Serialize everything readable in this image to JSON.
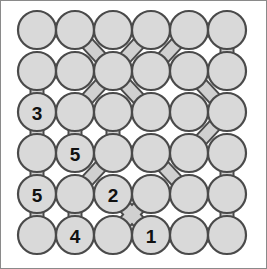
{
  "puzzle": {
    "title": "Circle Link Puzzle",
    "type": "circle-link-grid",
    "rows": 6,
    "cols": 6,
    "background_color": "#ffffff",
    "circle_fill": "#d9d9d9",
    "circle_stroke": "#4a4a4a",
    "link_fill": "#d0d0d0",
    "link_stroke": "#4a4a4a",
    "frame_stroke": "#8a8a8a",
    "geometry": {
      "origin_x": 36,
      "origin_y": 29,
      "step_x": 38,
      "step_y": 41,
      "radius": 19
    },
    "nodes": [
      {
        "id": "r1c1",
        "row": 1,
        "col": 1,
        "label": ""
      },
      {
        "id": "r1c2",
        "row": 1,
        "col": 2,
        "label": ""
      },
      {
        "id": "r1c3",
        "row": 1,
        "col": 3,
        "label": ""
      },
      {
        "id": "r1c4",
        "row": 1,
        "col": 4,
        "label": ""
      },
      {
        "id": "r1c5",
        "row": 1,
        "col": 5,
        "label": ""
      },
      {
        "id": "r1c6",
        "row": 1,
        "col": 6,
        "label": ""
      },
      {
        "id": "r2c1",
        "row": 2,
        "col": 1,
        "label": ""
      },
      {
        "id": "r2c2",
        "row": 2,
        "col": 2,
        "label": ""
      },
      {
        "id": "r2c3",
        "row": 2,
        "col": 3,
        "label": ""
      },
      {
        "id": "r2c4",
        "row": 2,
        "col": 4,
        "label": ""
      },
      {
        "id": "r2c5",
        "row": 2,
        "col": 5,
        "label": ""
      },
      {
        "id": "r2c6",
        "row": 2,
        "col": 6,
        "label": ""
      },
      {
        "id": "r3c1",
        "row": 3,
        "col": 1,
        "label": "3"
      },
      {
        "id": "r3c2",
        "row": 3,
        "col": 2,
        "label": ""
      },
      {
        "id": "r3c3",
        "row": 3,
        "col": 3,
        "label": ""
      },
      {
        "id": "r3c4",
        "row": 3,
        "col": 4,
        "label": ""
      },
      {
        "id": "r3c5",
        "row": 3,
        "col": 5,
        "label": ""
      },
      {
        "id": "r3c6",
        "row": 3,
        "col": 6,
        "label": ""
      },
      {
        "id": "r4c1",
        "row": 4,
        "col": 1,
        "label": ""
      },
      {
        "id": "r4c2",
        "row": 4,
        "col": 2,
        "label": "5"
      },
      {
        "id": "r4c3",
        "row": 4,
        "col": 3,
        "label": ""
      },
      {
        "id": "r4c4",
        "row": 4,
        "col": 4,
        "label": ""
      },
      {
        "id": "r4c5",
        "row": 4,
        "col": 5,
        "label": ""
      },
      {
        "id": "r4c6",
        "row": 4,
        "col": 6,
        "label": ""
      },
      {
        "id": "r5c1",
        "row": 5,
        "col": 1,
        "label": "5"
      },
      {
        "id": "r5c2",
        "row": 5,
        "col": 2,
        "label": ""
      },
      {
        "id": "r5c3",
        "row": 5,
        "col": 3,
        "label": "2"
      },
      {
        "id": "r5c4",
        "row": 5,
        "col": 4,
        "label": ""
      },
      {
        "id": "r5c5",
        "row": 5,
        "col": 5,
        "label": ""
      },
      {
        "id": "r5c6",
        "row": 5,
        "col": 6,
        "label": ""
      },
      {
        "id": "r6c1",
        "row": 6,
        "col": 1,
        "label": ""
      },
      {
        "id": "r6c2",
        "row": 6,
        "col": 2,
        "label": "4"
      },
      {
        "id": "r6c3",
        "row": 6,
        "col": 3,
        "label": ""
      },
      {
        "id": "r6c4",
        "row": 6,
        "col": 4,
        "label": "1"
      },
      {
        "id": "r6c5",
        "row": 6,
        "col": 5,
        "label": ""
      },
      {
        "id": "r6c6",
        "row": 6,
        "col": 6,
        "label": ""
      }
    ],
    "links": [
      {
        "from": "r1c1",
        "to": "r1c2",
        "kind": "horizontal"
      },
      {
        "from": "r1c5",
        "to": "r1c6",
        "kind": "horizontal"
      },
      {
        "from": "r1c2",
        "to": "r2c3",
        "kind": "diagonal"
      },
      {
        "from": "r1c4",
        "to": "r2c3",
        "kind": "diagonal"
      },
      {
        "from": "r1c5",
        "to": "r2c4",
        "kind": "diagonal"
      },
      {
        "from": "r1c6",
        "to": "r2c6",
        "kind": "vertical"
      },
      {
        "from": "r2c1",
        "to": "r2c2",
        "kind": "horizontal"
      },
      {
        "from": "r2c1",
        "to": "r3c1",
        "kind": "vertical"
      },
      {
        "from": "r2c3",
        "to": "r3c2",
        "kind": "diagonal"
      },
      {
        "from": "r2c3",
        "to": "r3c4",
        "kind": "diagonal"
      },
      {
        "from": "r2c5",
        "to": "r3c6",
        "kind": "diagonal"
      },
      {
        "from": "r3c1",
        "to": "r4c1",
        "kind": "vertical"
      },
      {
        "from": "r3c2",
        "to": "r4c2",
        "kind": "vertical"
      },
      {
        "from": "r3c3",
        "to": "r4c3",
        "kind": "vertical"
      },
      {
        "from": "r3c6",
        "to": "r4c5",
        "kind": "diagonal"
      },
      {
        "from": "r4c1",
        "to": "r5c1",
        "kind": "vertical"
      },
      {
        "from": "r4c3",
        "to": "r4c4",
        "kind": "horizontal"
      },
      {
        "from": "r4c3",
        "to": "r5c2",
        "kind": "diagonal"
      },
      {
        "from": "r4c4",
        "to": "r5c5",
        "kind": "diagonal"
      },
      {
        "from": "r4c6",
        "to": "r5c6",
        "kind": "vertical"
      },
      {
        "from": "r5c1",
        "to": "r6c1",
        "kind": "vertical"
      },
      {
        "from": "r5c2",
        "to": "r6c2",
        "kind": "vertical"
      },
      {
        "from": "r5c3",
        "to": "r6c4",
        "kind": "diagonal"
      },
      {
        "from": "r5c4",
        "to": "r6c3",
        "kind": "diagonal"
      },
      {
        "from": "r5c6",
        "to": "r6c6",
        "kind": "vertical"
      },
      {
        "from": "r6c4",
        "to": "r6c5",
        "kind": "horizontal"
      },
      {
        "from": "r6c5",
        "to": "r6c6",
        "kind": "horizontal"
      }
    ]
  }
}
